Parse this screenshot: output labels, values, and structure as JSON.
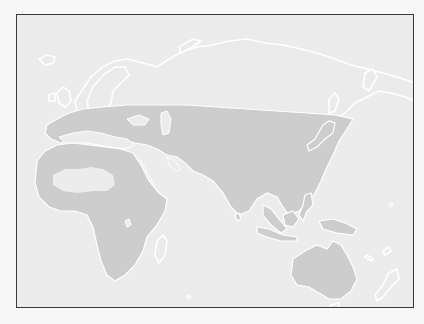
{
  "map": {
    "type": "species-range-map",
    "projection": "Eastern Hemisphere (Europe, Africa, Asia, Australia)",
    "colors": {
      "page_background": "#f7f7f7",
      "map_background": "#ececec",
      "land": "#ebebeb",
      "range_fill": "#cdcdcd",
      "coastline": "#ffffff",
      "frame_border": "#3a3a3a"
    },
    "regions_shaded": [
      "Southern Europe",
      "North Africa (excluding central Sahara)",
      "Sub-Saharan Africa",
      "Middle East",
      "Central Asia",
      "South Asia",
      "East Asia",
      "Japan",
      "Southeast Asia",
      "Indonesia",
      "New Guinea",
      "Australia"
    ],
    "regions_unshaded": [
      "Northern Europe / Scandinavia",
      "Siberia",
      "Central Sahara",
      "Madagascar",
      "New Zealand",
      "Tasmania"
    ]
  }
}
